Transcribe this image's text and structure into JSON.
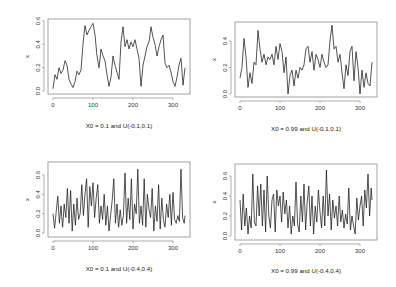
{
  "chart_data": [
    {
      "type": "line",
      "title": "",
      "caption": "X0 = 0.1 and U(-0.1,0.1)",
      "xlabel": "",
      "ylabel": "x",
      "xticks": [
        "0",
        "100",
        "200",
        "300"
      ],
      "yticks": [
        "0.0",
        "0.2",
        "0.4",
        "0.6"
      ],
      "xlim": [
        0,
        330
      ],
      "ylim": [
        0.0,
        0.6
      ],
      "grid": false,
      "series": [
        {
          "name": "x",
          "x": [
            0,
            5,
            10,
            15,
            20,
            25,
            30,
            35,
            40,
            45,
            50,
            55,
            60,
            65,
            70,
            75,
            80,
            85,
            90,
            95,
            100,
            105,
            110,
            115,
            120,
            125,
            130,
            135,
            140,
            145,
            150,
            155,
            160,
            165,
            170,
            175,
            180,
            185,
            190,
            195,
            200,
            205,
            210,
            215,
            220,
            225,
            230,
            235,
            240,
            245,
            250,
            255,
            260,
            265,
            270,
            275,
            280,
            285,
            290,
            295,
            300,
            305,
            310,
            315,
            320,
            325,
            330
          ],
          "values": [
            0.02,
            0.14,
            0.1,
            0.2,
            0.15,
            0.18,
            0.26,
            0.22,
            0.1,
            0.06,
            0.03,
            0.08,
            0.17,
            0.14,
            0.18,
            0.4,
            0.56,
            0.48,
            0.52,
            0.55,
            0.58,
            0.48,
            0.3,
            0.2,
            0.36,
            0.3,
            0.26,
            0.14,
            0.04,
            0.12,
            0.3,
            0.22,
            0.16,
            0.1,
            0.42,
            0.55,
            0.38,
            0.44,
            0.36,
            0.42,
            0.38,
            0.44,
            0.36,
            0.28,
            0.04,
            0.22,
            0.3,
            0.38,
            0.42,
            0.55,
            0.46,
            0.4,
            0.3,
            0.38,
            0.44,
            0.48,
            0.24,
            0.2,
            0.22,
            0.16,
            0.08,
            0.04,
            0.12,
            0.22,
            0.28,
            0.05,
            0.2
          ]
        }
      ]
    },
    {
      "type": "line",
      "title": "",
      "caption": "X0 = 0.99 and U(-0.1,0.1)",
      "xlabel": "",
      "ylabel": "x",
      "xticks": [
        "0",
        "100",
        "200",
        "300"
      ],
      "yticks": [
        "0.0",
        "0.2",
        "0.4"
      ],
      "xlim": [
        0,
        330
      ],
      "ylim": [
        0.0,
        0.52
      ],
      "grid": false,
      "series": [
        {
          "name": "x",
          "x": [
            0,
            5,
            10,
            15,
            20,
            25,
            30,
            35,
            40,
            45,
            50,
            55,
            60,
            65,
            70,
            75,
            80,
            85,
            90,
            95,
            100,
            105,
            110,
            115,
            120,
            125,
            130,
            135,
            140,
            145,
            150,
            155,
            160,
            165,
            170,
            175,
            180,
            185,
            190,
            195,
            200,
            205,
            210,
            215,
            220,
            225,
            230,
            235,
            240,
            245,
            250,
            255,
            260,
            265,
            270,
            275,
            280,
            285,
            290,
            295,
            300,
            305,
            310,
            315,
            320,
            325,
            330
          ],
          "values": [
            0.12,
            0.2,
            0.42,
            0.28,
            0.05,
            0.16,
            0.08,
            0.24,
            0.22,
            0.48,
            0.34,
            0.24,
            0.3,
            0.22,
            0.28,
            0.26,
            0.3,
            0.22,
            0.36,
            0.26,
            0.38,
            0.32,
            0.16,
            0.28,
            0.0,
            0.14,
            0.18,
            0.06,
            0.18,
            0.12,
            0.2,
            0.18,
            0.22,
            0.34,
            0.36,
            0.24,
            0.32,
            0.18,
            0.3,
            0.26,
            0.2,
            0.3,
            0.24,
            0.2,
            0.22,
            0.4,
            0.52,
            0.34,
            0.36,
            0.24,
            0.3,
            0.16,
            0.04,
            0.22,
            0.14,
            0.32,
            0.36,
            0.1,
            0.32,
            0.2,
            0.0,
            0.18,
            0.05,
            0.16,
            0.08,
            0.06,
            0.24
          ]
        }
      ]
    },
    {
      "type": "line",
      "title": "",
      "caption": "X0 = 0.1 and U(-0.4,0.4)",
      "xlabel": "",
      "ylabel": "x",
      "xticks": [
        "0",
        "100",
        "200",
        "300"
      ],
      "yticks": [
        "0.0",
        "0.2",
        "0.4",
        "0.6"
      ],
      "xlim": [
        0,
        330
      ],
      "ylim": [
        0.0,
        0.7
      ],
      "grid": false,
      "series": [
        {
          "name": "x",
          "x": [
            0,
            4,
            8,
            12,
            16,
            20,
            24,
            28,
            32,
            36,
            40,
            44,
            48,
            52,
            56,
            60,
            64,
            68,
            72,
            76,
            80,
            84,
            88,
            92,
            96,
            100,
            104,
            108,
            112,
            116,
            120,
            124,
            128,
            132,
            136,
            140,
            144,
            148,
            152,
            156,
            160,
            164,
            168,
            172,
            176,
            180,
            184,
            188,
            192,
            196,
            200,
            204,
            208,
            212,
            216,
            220,
            224,
            228,
            232,
            236,
            240,
            244,
            248,
            252,
            256,
            260,
            264,
            268,
            272,
            276,
            280,
            284,
            288,
            292,
            296,
            300,
            304,
            308,
            312,
            316,
            320,
            324,
            328,
            330
          ],
          "values": [
            0.2,
            0.05,
            0.22,
            0.38,
            0.1,
            0.28,
            0.06,
            0.3,
            0.16,
            0.46,
            0.1,
            0.44,
            0.02,
            0.3,
            0.08,
            0.36,
            0.14,
            0.2,
            0.5,
            0.18,
            0.4,
            0.56,
            0.06,
            0.48,
            0.28,
            0.52,
            0.16,
            0.36,
            0.5,
            0.1,
            0.28,
            0.14,
            0.4,
            0.08,
            0.28,
            0.02,
            0.18,
            0.34,
            0.56,
            0.1,
            0.3,
            0.06,
            0.24,
            0.08,
            0.18,
            0.62,
            0.1,
            0.36,
            0.14,
            0.56,
            0.04,
            0.3,
            0.2,
            0.66,
            0.1,
            0.28,
            0.08,
            0.56,
            0.06,
            0.4,
            0.24,
            0.16,
            0.46,
            0.02,
            0.28,
            0.12,
            0.5,
            0.04,
            0.36,
            0.14,
            0.06,
            0.3,
            0.16,
            0.4,
            0.08,
            0.42,
            0.14,
            0.1,
            0.18,
            0.12,
            0.66,
            0.16,
            0.1,
            0.18
          ]
        }
      ]
    },
    {
      "type": "line",
      "title": "",
      "caption": "X0 = 0.99 and U(-0.4,0.4)",
      "xlabel": "",
      "ylabel": "x",
      "xticks": [
        "0",
        "100",
        "200",
        "300"
      ],
      "yticks": [
        "0.0",
        "0.2",
        "0.4",
        "0.6"
      ],
      "xlim": [
        0,
        330
      ],
      "ylim": [
        0.0,
        0.68
      ],
      "grid": false,
      "series": [
        {
          "name": "x",
          "x": [
            0,
            4,
            8,
            12,
            16,
            20,
            24,
            28,
            32,
            36,
            40,
            44,
            48,
            52,
            56,
            60,
            64,
            68,
            72,
            76,
            80,
            84,
            88,
            92,
            96,
            100,
            104,
            108,
            112,
            116,
            120,
            124,
            128,
            132,
            136,
            140,
            144,
            148,
            152,
            156,
            160,
            164,
            168,
            172,
            176,
            180,
            184,
            188,
            192,
            196,
            200,
            204,
            208,
            212,
            216,
            220,
            224,
            228,
            232,
            236,
            240,
            244,
            248,
            252,
            256,
            260,
            264,
            268,
            272,
            276,
            280,
            284,
            288,
            292,
            296,
            300,
            304,
            308,
            312,
            316,
            320,
            324,
            328,
            330
          ],
          "values": [
            0.36,
            0.06,
            0.42,
            0.1,
            0.28,
            0.02,
            0.2,
            0.08,
            0.62,
            0.14,
            0.1,
            0.5,
            0.2,
            0.52,
            0.1,
            0.46,
            0.04,
            0.6,
            0.2,
            0.08,
            0.36,
            0.42,
            0.04,
            0.46,
            0.3,
            0.4,
            0.14,
            0.44,
            0.22,
            0.36,
            0.08,
            0.3,
            0.02,
            0.2,
            0.1,
            0.54,
            0.12,
            0.04,
            0.4,
            0.14,
            0.52,
            0.06,
            0.34,
            0.5,
            0.1,
            0.4,
            0.02,
            0.3,
            0.14,
            0.46,
            0.24,
            0.08,
            0.4,
            0.1,
            0.66,
            0.2,
            0.42,
            0.06,
            0.36,
            0.18,
            0.3,
            0.1,
            0.4,
            0.14,
            0.26,
            0.08,
            0.22,
            0.12,
            0.48,
            0.06,
            0.2,
            0.1,
            0.02,
            0.38,
            0.16,
            0.3,
            0.4,
            0.1,
            0.46,
            0.28,
            0.62,
            0.2,
            0.48,
            0.36
          ]
        }
      ]
    }
  ],
  "panels_layout": [
    {
      "box": [
        48,
        19,
        190,
        94
      ],
      "x0px": 53,
      "xscale": 0.4,
      "y0px": 91,
      "yscale": 116.7
    },
    {
      "box": [
        235,
        22,
        377,
        97
      ],
      "x0px": 240,
      "xscale": 0.4,
      "y0px": 94,
      "yscale": 132.5
    },
    {
      "box": [
        48,
        162,
        190,
        237
      ],
      "x0px": 53,
      "xscale": 0.4,
      "y0px": 233,
      "yscale": 96.7
    },
    {
      "box": [
        235,
        164,
        377,
        240
      ],
      "x0px": 240,
      "xscale": 0.4,
      "y0px": 236,
      "yscale": 100
    }
  ]
}
